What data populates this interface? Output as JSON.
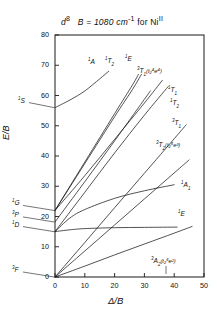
{
  "figure": {
    "title_main": "d",
    "title_sup": "8",
    "title_rest": "B = 1080 cm",
    "title_rest_sup": "-1",
    "title_tail": " for Ni",
    "title_tail_sup": "II",
    "xlabel": "Δ/B",
    "ylabel": "E/B"
  },
  "axes": {
    "xticks": [
      "0",
      "10",
      "20",
      "30",
      "40",
      "50"
    ],
    "yticks": [
      "0",
      "10",
      "20",
      "30",
      "40",
      "50",
      "60",
      "70",
      "80"
    ],
    "xlim": [
      0,
      50
    ],
    "ylim": [
      0,
      80
    ]
  },
  "free_ion_labels": [
    {
      "id": "1S",
      "mult": "1",
      "term": "S",
      "y": 56.0
    },
    {
      "id": "1G",
      "mult": "1",
      "term": "G",
      "y": 22.0
    },
    {
      "id": "3P",
      "mult": "3",
      "term": "P",
      "y": 18.2
    },
    {
      "id": "1D",
      "mult": "1",
      "term": "D",
      "y": 15.0
    },
    {
      "id": "3F",
      "mult": "3",
      "term": "F",
      "y": 0.0
    }
  ],
  "curve_labels": [
    {
      "id": "1A",
      "mult": "1",
      "sym": "A",
      "idx": "",
      "conf": ""
    },
    {
      "id": "1T2",
      "mult": "1",
      "sym": "T",
      "idx": "2",
      "conf": ""
    },
    {
      "id": "1E-upper",
      "mult": "1",
      "sym": "E",
      "idx": "",
      "conf": ""
    },
    {
      "id": "3T1-high",
      "mult": "3",
      "sym": "T",
      "idx": "1",
      "conf": "(t₂⁴e⁴)"
    },
    {
      "id": "1T1",
      "mult": "1",
      "sym": "T",
      "idx": "1",
      "conf": ""
    },
    {
      "id": "1T2-b",
      "mult": "1",
      "sym": "T",
      "idx": "2",
      "conf": ""
    },
    {
      "id": "3T1",
      "mult": "3",
      "sym": "T",
      "idx": "1",
      "conf": ""
    },
    {
      "id": "3T2",
      "mult": "3",
      "sym": "T",
      "idx": "2",
      "conf": "(t₂⁵e³)"
    },
    {
      "id": "1A1",
      "mult": "1",
      "sym": "A",
      "idx": "1",
      "conf": ""
    },
    {
      "id": "1E-low",
      "mult": "1",
      "sym": "E",
      "idx": "",
      "conf": ""
    },
    {
      "id": "3A2",
      "mult": "3",
      "sym": "A",
      "idx": "2",
      "conf": "(t₂⁶e²)"
    }
  ],
  "chart_data": {
    "type": "line",
    "xlabel": "Δ/B",
    "ylabel": "E/B",
    "xlim": [
      0,
      50
    ],
    "ylim": [
      0,
      80
    ],
    "grid": false,
    "legend": "inline-end-labels",
    "series": [
      {
        "name": "3A2(t2^6 e^2)",
        "x": [
          0,
          10,
          20,
          30,
          40,
          46
        ],
        "y": [
          0.0,
          3.6,
          7.3,
          10.9,
          14.5,
          16.7
        ]
      },
      {
        "name": "3T2(t2^5 e^3)",
        "x": [
          0,
          10,
          20,
          30,
          40,
          45
        ],
        "y": [
          0.0,
          8.6,
          17.2,
          25.8,
          34.4,
          38.7
        ]
      },
      {
        "name": "3T1",
        "x": [
          0,
          10,
          20,
          30,
          40,
          44
        ],
        "y": [
          0.0,
          11.4,
          22.9,
          34.3,
          45.7,
          50.3
        ]
      },
      {
        "name": "1E(low)",
        "x": [
          0,
          5,
          10,
          20,
          30,
          41
        ],
        "y": [
          15.0,
          15.6,
          16.0,
          16.3,
          16.4,
          16.5
        ]
      },
      {
        "name": "1A1",
        "x": [
          0,
          5,
          10,
          20,
          30,
          40
        ],
        "y": [
          15.0,
          19.5,
          22.3,
          26.0,
          28.5,
          30.5
        ]
      },
      {
        "name": "1T2(b)",
        "x": [
          0,
          10,
          20,
          30,
          38
        ],
        "y": [
          15.0,
          28.0,
          41.0,
          53.5,
          63.0
        ]
      },
      {
        "name": "1T1",
        "x": [
          0,
          10,
          20,
          30,
          36
        ],
        "y": [
          22.0,
          33.5,
          45.5,
          57.5,
          65.0
        ]
      },
      {
        "name": "3T1(t2^4 e^4)",
        "x": [
          0,
          10,
          20,
          28,
          32
        ],
        "y": [
          18.2,
          31.5,
          45.0,
          56.0,
          61.5
        ]
      },
      {
        "name": "1E(upper)",
        "x": [
          0,
          10,
          20,
          26,
          29
        ],
        "y": [
          22.0,
          37.5,
          53.0,
          62.0,
          67.0
        ]
      },
      {
        "name": "1T2",
        "x": [
          0,
          10,
          20,
          26,
          28
        ],
        "y": [
          22.0,
          38.0,
          54.0,
          63.5,
          67.0
        ]
      },
      {
        "name": "1A(from 1S)",
        "x": [
          0,
          5,
          10,
          15,
          18
        ],
        "y": [
          56.0,
          58.5,
          61.5,
          65.5,
          68.0
        ]
      }
    ]
  }
}
